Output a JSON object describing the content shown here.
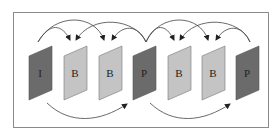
{
  "diagram": {
    "type": "gop-frame-prediction",
    "frames": [
      {
        "label": "I",
        "kind": "I",
        "color": "#6b6b6b"
      },
      {
        "label": "B",
        "kind": "B",
        "color": "#c4c4c4"
      },
      {
        "label": "B",
        "kind": "B",
        "color": "#c4c4c4"
      },
      {
        "label": "P",
        "kind": "P",
        "color": "#6b6b6b"
      },
      {
        "label": "B",
        "kind": "B",
        "color": "#c4c4c4"
      },
      {
        "label": "B",
        "kind": "B",
        "color": "#c4c4c4"
      },
      {
        "label": "P",
        "kind": "P",
        "color": "#6b6b6b"
      }
    ],
    "forward_predictions": [
      {
        "from": 0,
        "to": 3
      },
      {
        "from": 3,
        "to": 6
      }
    ],
    "bidirectional_predictions": [
      {
        "from": 0,
        "to": 1
      },
      {
        "from": 0,
        "to": 2
      },
      {
        "from": 3,
        "to": 1
      },
      {
        "from": 3,
        "to": 2
      },
      {
        "from": 3,
        "to": 4
      },
      {
        "from": 3,
        "to": 5
      },
      {
        "from": 6,
        "to": 4
      },
      {
        "from": 6,
        "to": 5
      }
    ],
    "colors": {
      "reference_frame": "#6b6b6b",
      "b_frame": "#c4c4c4",
      "arrow": "#333333",
      "border": "#8a8a8a"
    }
  }
}
